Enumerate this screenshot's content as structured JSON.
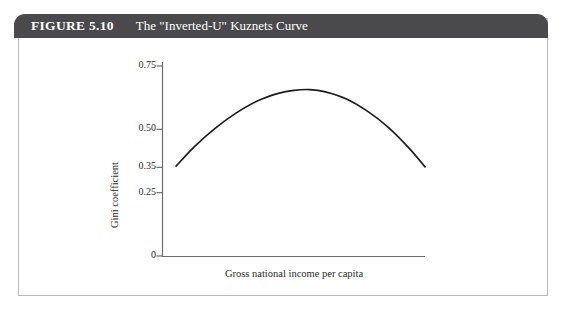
{
  "figure": {
    "number_label": "FIGURE 5.10",
    "title": "The \"Inverted-U\" Kuznets Curve",
    "header_color": "#4a4a4c",
    "border_color": "#b9b9bb",
    "background_color": "#ffffff"
  },
  "chart_data": {
    "type": "line",
    "title": "The \"Inverted-U\" Kuznets Curve",
    "xlabel": "Gross national income per capita",
    "ylabel": "Gini coefficient",
    "ylim": [
      0,
      0.78
    ],
    "xlim": [
      0,
      1
    ],
    "grid": false,
    "legend": null,
    "ytick_labels": [
      "0.75",
      "0.50",
      "0.35",
      "0.25",
      "0"
    ],
    "ytick_values": [
      0.75,
      0.5,
      0.35,
      0.25,
      0
    ],
    "xtick_labels": [],
    "line_color": "#1d1d1d",
    "series": [
      {
        "name": "Kuznets curve",
        "x": [
          0.05,
          0.12,
          0.2,
          0.28,
          0.36,
          0.44,
          0.5,
          0.56,
          0.62,
          0.7,
          0.78,
          0.86,
          0.94,
          1.0
        ],
        "y": [
          0.355,
          0.432,
          0.505,
          0.565,
          0.612,
          0.642,
          0.654,
          0.657,
          0.648,
          0.62,
          0.572,
          0.508,
          0.425,
          0.352
        ]
      }
    ],
    "annotations": []
  }
}
